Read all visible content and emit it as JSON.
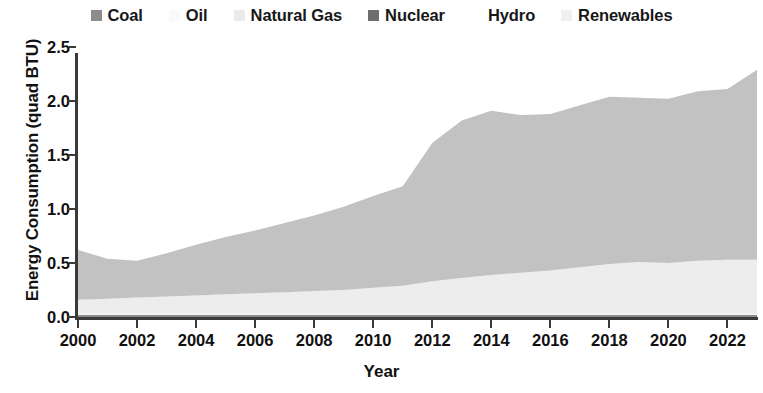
{
  "chart_data": {
    "type": "area",
    "stacked": true,
    "title": "",
    "xlabel": "Year",
    "ylabel": "Energy Consumption (quad BTU)",
    "xlim": [
      2000,
      2023
    ],
    "ylim": [
      0.0,
      2.5
    ],
    "grid": false,
    "legend_position": "top-center",
    "x": [
      2000,
      2001,
      2002,
      2003,
      2004,
      2005,
      2006,
      2007,
      2008,
      2009,
      2010,
      2011,
      2012,
      2013,
      2014,
      2015,
      2016,
      2017,
      2018,
      2019,
      2020,
      2021,
      2022,
      2023
    ],
    "categories": [
      "2000",
      "2001",
      "2002",
      "2003",
      "2004",
      "2005",
      "2006",
      "2007",
      "2008",
      "2009",
      "2010",
      "2011",
      "2012",
      "2013",
      "2014",
      "2015",
      "2016",
      "2017",
      "2018",
      "2019",
      "2020",
      "2021",
      "2022",
      "2023"
    ],
    "series": [
      {
        "name": "Coal",
        "color": "#8c8c8c",
        "values": [
          0.02,
          0.02,
          0.02,
          0.02,
          0.02,
          0.02,
          0.02,
          0.02,
          0.02,
          0.02,
          0.02,
          0.02,
          0.02,
          0.02,
          0.02,
          0.02,
          0.02,
          0.02,
          0.02,
          0.02,
          0.02,
          0.02,
          0.02,
          0.02
        ]
      },
      {
        "name": "Oil",
        "color": "#fbfbfb",
        "values": [
          0.01,
          0.01,
          0.01,
          0.01,
          0.01,
          0.01,
          0.01,
          0.01,
          0.01,
          0.01,
          0.01,
          0.01,
          0.01,
          0.01,
          0.01,
          0.01,
          0.01,
          0.01,
          0.01,
          0.01,
          0.01,
          0.01,
          0.01,
          0.01
        ]
      },
      {
        "name": "Natural Gas",
        "color": "#ededed",
        "values": [
          0.13,
          0.14,
          0.15,
          0.16,
          0.17,
          0.18,
          0.19,
          0.2,
          0.21,
          0.22,
          0.24,
          0.26,
          0.3,
          0.33,
          0.36,
          0.38,
          0.4,
          0.43,
          0.46,
          0.48,
          0.47,
          0.49,
          0.5,
          0.5
        ]
      },
      {
        "name": "Nuclear",
        "color": "#6e6e6e",
        "values": [
          0.0,
          0.0,
          0.0,
          0.0,
          0.0,
          0.0,
          0.0,
          0.0,
          0.0,
          0.0,
          0.0,
          0.0,
          0.0,
          0.0,
          0.0,
          0.0,
          0.0,
          0.0,
          0.0,
          0.0,
          0.0,
          0.0,
          0.0,
          0.0
        ]
      },
      {
        "name": "Hydro",
        "color": "#fefefe",
        "values": [
          0.0,
          0.0,
          0.0,
          0.0,
          0.0,
          0.0,
          0.0,
          0.0,
          0.0,
          0.0,
          0.0,
          0.0,
          0.0,
          0.0,
          0.0,
          0.0,
          0.0,
          0.0,
          0.0,
          0.0,
          0.0,
          0.0,
          0.0,
          0.0
        ]
      },
      {
        "name": "Renewables",
        "color": "#c2c2c2",
        "values": [
          0.46,
          0.37,
          0.34,
          0.4,
          0.47,
          0.53,
          0.58,
          0.64,
          0.7,
          0.77,
          0.85,
          0.92,
          1.28,
          1.46,
          1.52,
          1.46,
          1.45,
          1.5,
          1.55,
          1.52,
          1.52,
          1.57,
          1.58,
          1.76
        ]
      }
    ],
    "totals": [
      0.62,
      0.54,
      0.52,
      0.59,
      0.67,
      0.74,
      0.8,
      0.87,
      0.94,
      1.02,
      1.12,
      1.21,
      1.61,
      1.82,
      2.07,
      1.87,
      1.88,
      1.96,
      2.04,
      2.03,
      2.02,
      2.09,
      2.11,
      2.29
    ]
  },
  "legend": {
    "items": [
      {
        "label": "Coal",
        "swatch": "#8c8c8c"
      },
      {
        "label": "Oil",
        "swatch": "#fafafa"
      },
      {
        "label": "Natural Gas",
        "swatch": "#ebebeb"
      },
      {
        "label": "Nuclear",
        "swatch": "#6e6e6e"
      },
      {
        "label": "Hydro",
        "swatch": "#ffffff"
      },
      {
        "label": "Renewables",
        "swatch": "#f0f0f0"
      }
    ]
  },
  "axes": {
    "y": {
      "title": "Energy Consumption (quad BTU)",
      "ticks": [
        "0.0",
        "0.5",
        "1.0",
        "1.5",
        "2.0",
        "2.5"
      ],
      "values": [
        0.0,
        0.5,
        1.0,
        1.5,
        2.0,
        2.5
      ]
    },
    "x": {
      "title": "Year",
      "ticks": [
        "2000",
        "2002",
        "2004",
        "2006",
        "2008",
        "2010",
        "2012",
        "2014",
        "2016",
        "2018",
        "2020",
        "2022"
      ],
      "values": [
        2000,
        2002,
        2004,
        2006,
        2008,
        2010,
        2012,
        2014,
        2016,
        2018,
        2020,
        2022
      ]
    }
  }
}
